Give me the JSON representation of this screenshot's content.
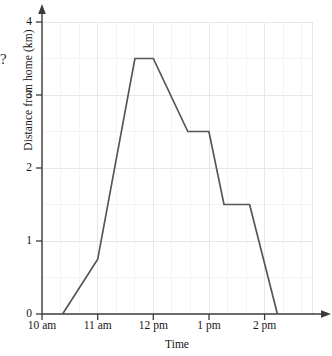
{
  "chart_data": {
    "type": "line",
    "title": "",
    "subtitle": "",
    "xlabel": "Time",
    "ylabel": "Distance from home (km)",
    "xlim": [
      10,
      15
    ],
    "ylim": [
      0,
      4.2
    ],
    "grid": true,
    "legend": false,
    "minor_grid_x_per_unit": 3,
    "minor_grid_y_per_unit": 2,
    "y_ticks": [
      {
        "value": 0,
        "label": "0"
      },
      {
        "value": 1,
        "label": "1"
      },
      {
        "value": 2,
        "label": "2"
      },
      {
        "value": 3,
        "label": "3"
      },
      {
        "value": 4,
        "label": "4"
      }
    ],
    "x_ticks": [
      {
        "value": 10,
        "label": "10 am"
      },
      {
        "value": 11,
        "label": "11 am"
      },
      {
        "value": 12,
        "label": "12 pm"
      },
      {
        "value": 13,
        "label": "1 pm"
      },
      {
        "value": 14,
        "label": "2 pm"
      }
    ],
    "series": [
      {
        "name": "Distance from home",
        "color": "#555555",
        "points": [
          {
            "x": 10.37,
            "y": 0,
            "time": "10:22 am",
            "distance_km": 0
          },
          {
            "x": 11.0,
            "y": 0.75,
            "time": "11 am",
            "distance_km": 0.75
          },
          {
            "x": 11.67,
            "y": 3.5,
            "time": "11:40 am",
            "distance_km": 3.5
          },
          {
            "x": 12.0,
            "y": 3.5,
            "time": "12 pm",
            "distance_km": 3.5
          },
          {
            "x": 12.62,
            "y": 2.5,
            "time": "12:37 pm",
            "distance_km": 2.5
          },
          {
            "x": 13.0,
            "y": 2.5,
            "time": "1 pm",
            "distance_km": 2.5
          },
          {
            "x": 13.27,
            "y": 1.5,
            "time": "1:16 pm",
            "distance_km": 1.5
          },
          {
            "x": 13.73,
            "y": 1.5,
            "time": "1:44 pm",
            "distance_km": 1.5
          },
          {
            "x": 14.23,
            "y": 0,
            "time": "2:14 pm",
            "distance_km": 0
          }
        ]
      }
    ],
    "annotations": [
      {
        "name": "stray-question-mark",
        "text": "?",
        "x_px": 1,
        "y_px": 52
      }
    ],
    "colors": {
      "line": "#555555",
      "axis": "#3b3b3b",
      "major_grid": "#e6e6ec",
      "minor_grid": "#f3f3f7",
      "text": "#151515",
      "background": "#ffffff"
    }
  }
}
